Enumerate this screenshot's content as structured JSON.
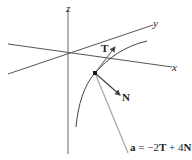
{
  "diagram": {
    "axes": {
      "x_label": "x",
      "y_label": "y",
      "z_label": "z"
    },
    "vectors": {
      "tangent_label": "T",
      "normal_label": "N",
      "acceleration_label_bold": "a",
      "acceleration_eq": " = −2",
      "acceleration_T": "T",
      "acceleration_plus": " + 4",
      "acceleration_N": "N"
    },
    "colors": {
      "axis": "#555555",
      "curve": "#444444",
      "vector": "#444444",
      "acceleration": "#aaaaaa"
    }
  }
}
